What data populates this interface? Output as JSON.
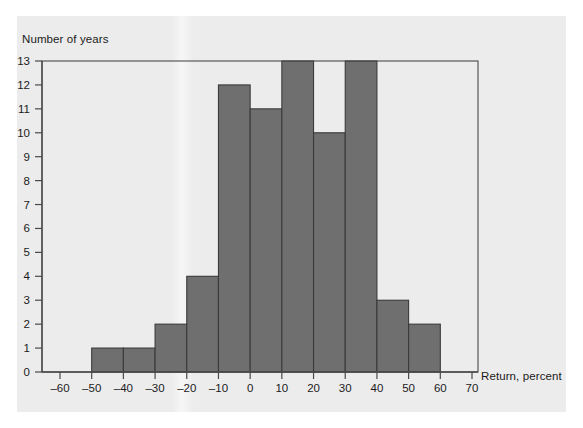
{
  "figure": {
    "background_color": "#ffffff",
    "panel_color": "#ececec"
  },
  "axis_titles": {
    "y": "Number of years",
    "x": "Return, percent"
  },
  "style": {
    "bar_fill": "#6f6f6f",
    "bar_stroke": "#3a3a3a",
    "frame_color": "#4a4a4a",
    "text_color": "#1b1b1b"
  },
  "chart_data": {
    "type": "bar",
    "title": "",
    "subtitle": "",
    "xlabel": "Return, percent",
    "ylabel": "Number of years",
    "xlim": [
      -60,
      70
    ],
    "ylim": [
      0,
      13
    ],
    "grid": false,
    "legend": "none",
    "bin_width": 10,
    "xticks": [
      -60,
      -50,
      -40,
      -30,
      -20,
      -10,
      0,
      10,
      20,
      30,
      40,
      50,
      60,
      70
    ],
    "xtick_labels": [
      "–60",
      "–50",
      "–40",
      "–30",
      "–20",
      "–10",
      "0",
      "10",
      "20",
      "30",
      "40",
      "50",
      "60",
      "70"
    ],
    "yticks": [
      0,
      1,
      2,
      3,
      4,
      5,
      6,
      7,
      8,
      9,
      10,
      11,
      12,
      13
    ],
    "ytick_labels": [
      "0",
      "1",
      "2",
      "3",
      "4",
      "5",
      "6",
      "7",
      "8",
      "9",
      "10",
      "11",
      "12",
      "13"
    ],
    "bins": [
      {
        "start": -60,
        "end": -50,
        "label": "–60 to –50",
        "value": 0
      },
      {
        "start": -50,
        "end": -40,
        "label": "–50 to –40",
        "value": 1
      },
      {
        "start": -40,
        "end": -30,
        "label": "–40 to –30",
        "value": 1
      },
      {
        "start": -30,
        "end": -20,
        "label": "–30 to –20",
        "value": 2
      },
      {
        "start": -20,
        "end": -10,
        "label": "–20 to –10",
        "value": 4
      },
      {
        "start": -10,
        "end": 0,
        "label": "–10 to 0",
        "value": 12
      },
      {
        "start": 0,
        "end": 10,
        "label": "0 to 10",
        "value": 11
      },
      {
        "start": 10,
        "end": 20,
        "label": "10 to 20",
        "value": 13
      },
      {
        "start": 20,
        "end": 30,
        "label": "20 to 30",
        "value": 10
      },
      {
        "start": 30,
        "end": 40,
        "label": "30 to 40",
        "value": 13
      },
      {
        "start": 40,
        "end": 50,
        "label": "40 to 50",
        "value": 3
      },
      {
        "start": 50,
        "end": 60,
        "label": "50 to 60",
        "value": 2
      },
      {
        "start": 60,
        "end": 70,
        "label": "60 to 70",
        "value": 0
      }
    ],
    "categories": [
      "–60 to –50",
      "–50 to –40",
      "–40 to –30",
      "–30 to –20",
      "–20 to –10",
      "–10 to 0",
      "0 to 10",
      "10 to 20",
      "20 to 30",
      "30 to 40",
      "40 to 50",
      "50 to 60",
      "60 to 70"
    ],
    "values": [
      0,
      1,
      1,
      2,
      4,
      12,
      11,
      13,
      10,
      13,
      3,
      2,
      0
    ]
  }
}
